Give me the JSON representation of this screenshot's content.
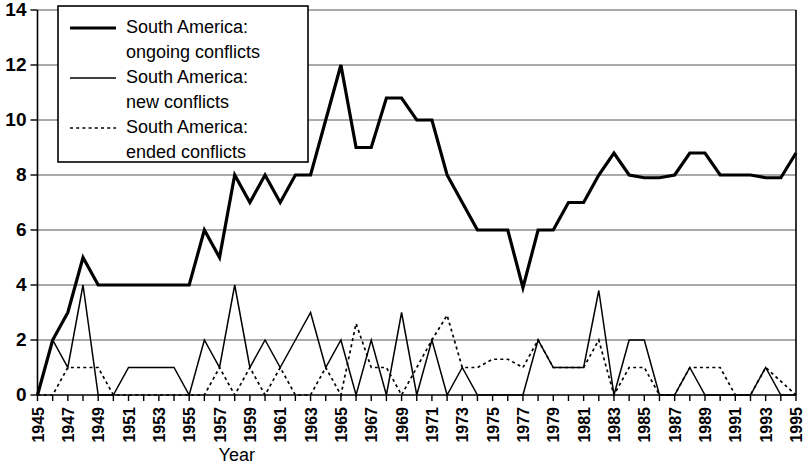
{
  "chart_data": {
    "type": "line",
    "title": "",
    "xlabel": "Year",
    "ylabel": "",
    "xlim": [
      1945,
      1995
    ],
    "ylim": [
      0,
      14
    ],
    "ytick_step": 2,
    "yticks": [
      0,
      2,
      4,
      6,
      8,
      10,
      12,
      14
    ],
    "grid": true,
    "grid_axis": "y",
    "legend_position": "top-left",
    "x": [
      1945,
      1946,
      1947,
      1948,
      1949,
      1950,
      1951,
      1952,
      1953,
      1954,
      1955,
      1956,
      1957,
      1958,
      1959,
      1960,
      1961,
      1962,
      1963,
      1964,
      1965,
      1966,
      1967,
      1968,
      1969,
      1970,
      1971,
      1972,
      1973,
      1974,
      1975,
      1976,
      1977,
      1978,
      1979,
      1980,
      1981,
      1982,
      1983,
      1984,
      1985,
      1986,
      1987,
      1988,
      1989,
      1990,
      1991,
      1992,
      1993,
      1994,
      1995
    ],
    "xtick_labels": [
      "1945",
      "1946",
      "1947",
      "1948",
      "1949",
      "1950",
      "1951",
      "1952",
      "1953",
      "1954",
      "1955",
      "1956",
      "1957",
      "1958",
      "1959",
      "1960",
      "1961",
      "1962",
      "1963",
      "1964",
      "1965",
      "1966",
      "1967",
      "1968",
      "1969",
      "1970",
      "1971",
      "1972",
      "1973",
      "1974",
      "1975",
      "1976",
      "1977",
      "1978",
      "1979",
      "1980",
      "1981",
      "1982",
      "1983",
      "1984",
      "1985",
      "1986",
      "1987",
      "1988",
      "1989",
      "1990",
      "1991",
      "1992",
      "1993",
      "1994",
      "1995"
    ],
    "xtick_labels_shown": [
      "1945",
      "1947",
      "1949",
      "1951",
      "1953",
      "1955",
      "1957",
      "1959",
      "1961",
      "1963",
      "1965",
      "1967",
      "1969",
      "1971",
      "1973",
      "1975",
      "1977",
      "1979",
      "1981",
      "1983",
      "1985",
      "1987",
      "1989",
      "1991",
      "1993",
      "1995"
    ],
    "series": [
      {
        "name": "South America: ongoing conflicts",
        "style": "thick-solid",
        "color": "#000000",
        "values": [
          0,
          2,
          3,
          5,
          4,
          4,
          4,
          4,
          4,
          4,
          4,
          6,
          5,
          8,
          7,
          8,
          7,
          8,
          8,
          10,
          12,
          9,
          9,
          10.8,
          10.8,
          10,
          10,
          8,
          7,
          6,
          6,
          6,
          3.9,
          6,
          6,
          7,
          7,
          8,
          8.8,
          8,
          7.9,
          7.9,
          8,
          8.8,
          8.8,
          8,
          8,
          8,
          7.9,
          7.9,
          8.8
        ]
      },
      {
        "name": "South America: new conflicts",
        "style": "thin-solid",
        "color": "#000000",
        "values": [
          0,
          2,
          1,
          4,
          0,
          0,
          1,
          1,
          1,
          1,
          0,
          2,
          1,
          4,
          1,
          2,
          1,
          2,
          3,
          1,
          2,
          0,
          2,
          0,
          3,
          0,
          2,
          0,
          1,
          0,
          0,
          0,
          0,
          2,
          1,
          1,
          1,
          3.8,
          0,
          2,
          2,
          0,
          0,
          1,
          0,
          0,
          0,
          0,
          1,
          0,
          0
        ]
      },
      {
        "name": "South America: ended conflicts",
        "style": "dotted",
        "color": "#000000",
        "values": [
          0,
          0,
          1,
          1,
          1,
          0,
          0,
          0,
          0,
          0,
          0,
          0,
          1,
          0,
          1,
          0,
          1,
          0,
          0,
          1,
          0,
          2.6,
          1,
          1,
          0,
          1,
          2,
          2.9,
          1,
          1,
          1.3,
          1.3,
          1,
          2,
          1,
          1,
          1,
          2,
          0,
          1,
          1,
          0,
          0,
          1,
          1,
          1,
          0,
          0,
          1,
          0.5,
          0
        ]
      }
    ]
  },
  "legend": {
    "items": [
      {
        "label_line1": "South America:",
        "label_line2": "ongoing conflicts",
        "style": "thick-solid"
      },
      {
        "label_line1": "South America:",
        "label_line2": "new conflicts",
        "style": "thin-solid"
      },
      {
        "label_line1": "South America:",
        "label_line2": "ended conflicts",
        "style": "dotted"
      }
    ]
  },
  "axis": {
    "x_title": "Year"
  }
}
